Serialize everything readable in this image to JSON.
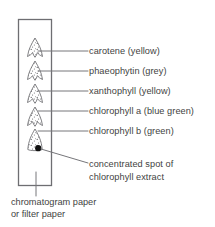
{
  "diagram": {
    "paper": {
      "name": "chromatogram paper",
      "caption_line1": "chromatogram paper",
      "caption_line2": "or filter paper",
      "outline_color": "#6e6e72",
      "fill_color": "#ffffff"
    },
    "origin_spot": {
      "label_line1": "concentrated spot of",
      "label_line2": "chlorophyll extract",
      "color": "#111111"
    },
    "pigment_bands": [
      {
        "id": "carotene",
        "label": "carotene (yellow)",
        "pigment": "carotene",
        "colour_word": "yellow"
      },
      {
        "id": "phaeophytin",
        "label": "phaeophytin (grey)",
        "pigment": "phaeophytin",
        "colour_word": "grey"
      },
      {
        "id": "xanthophyll",
        "label": "xanthophyll (yellow)",
        "pigment": "xanthophyll",
        "colour_word": "yellow"
      },
      {
        "id": "chlorophyll-a",
        "label": "chlorophyll a (blue green)",
        "pigment": "chlorophyll a",
        "colour_word": "blue green"
      },
      {
        "id": "chlorophyll-b",
        "label": "chlorophyll b (green)",
        "pigment": "chlorophyll b",
        "colour_word": "green"
      }
    ],
    "colors": {
      "text": "#3f3f42",
      "line": "#76767a",
      "spot_outline": "#6a6a6e",
      "stipple": "#55555a",
      "background": "#ffffff"
    }
  }
}
